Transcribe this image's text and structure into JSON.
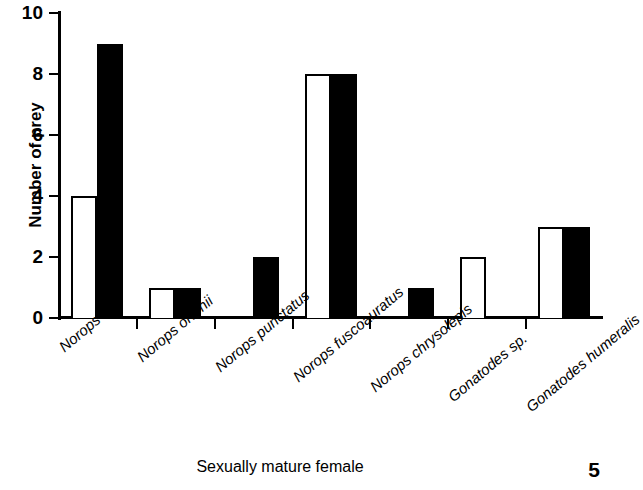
{
  "chart_data": {
    "type": "bar",
    "title": "",
    "subtitle": "",
    "xlabel": "Sexually mature female",
    "ylabel": "Number of prey",
    "categories": [
      "Norops sp.",
      "Norops ortonii",
      "Norops punctatus",
      "Norops fuscoauratus",
      "Norops chrysolepis",
      "Gonatodes sp.",
      "Gonatodes humeralis"
    ],
    "series": [
      {
        "name": "open",
        "fill": "#ffffff",
        "values": [
          4,
          1,
          0,
          8,
          0,
          2,
          3
        ]
      },
      {
        "name": "filled",
        "fill": "#000000",
        "values": [
          9,
          1,
          2,
          8,
          1,
          0,
          3
        ]
      }
    ],
    "ylim": [
      0,
      10
    ],
    "ytick_values": [
      0,
      2,
      4,
      6,
      8,
      10
    ],
    "ytick_labels": [
      "0",
      "2",
      "4",
      "6",
      "8",
      "10"
    ],
    "grid": false,
    "legend": "none",
    "bar_style": "grouped-paired",
    "xlabel_rotation_deg": -40
  },
  "footer": {
    "page_number": "5"
  }
}
